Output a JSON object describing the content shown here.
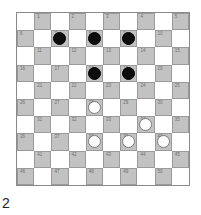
{
  "board": {
    "size": 10,
    "colors": {
      "light": "#ffffff",
      "dark": "#c2c2c2",
      "black_piece": "#0d0d0d",
      "white_piece": "#ffffff"
    },
    "numbers_on_dark_squares": true,
    "pieces": {
      "black": [
        7,
        8,
        9,
        18,
        19
      ],
      "white": [
        28,
        34,
        38,
        39,
        40
      ]
    }
  },
  "caption": "2"
}
